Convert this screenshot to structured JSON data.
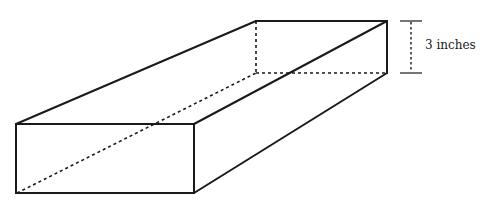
{
  "figure": {
    "dimension_labels": {
      "height": "3 inches"
    }
  }
}
